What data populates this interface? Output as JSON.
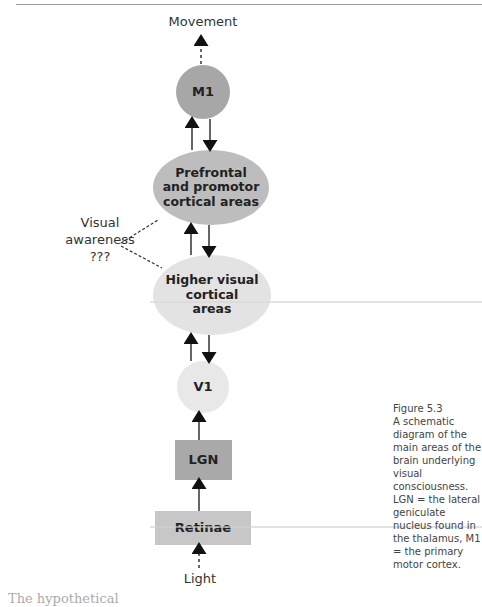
{
  "figure": {
    "top_label": "Movement",
    "bottom_label": "Light",
    "side_label": {
      "line1": "Visual",
      "line2": "awareness",
      "line3": "???"
    },
    "nodes": [
      {
        "id": "m1",
        "label": "M1",
        "shape": "circle",
        "color": "#a7a7a7"
      },
      {
        "id": "prefrontal",
        "label": "Prefrontal and promotor cortical areas",
        "shape": "ellipse",
        "color": "#bdbdbd"
      },
      {
        "id": "higher-visual",
        "label": "Higher visual cortical areas",
        "shape": "ellipse",
        "color": "#e3e3e3"
      },
      {
        "id": "v1",
        "label": "V1",
        "shape": "circle",
        "color": "#e8e8e8"
      },
      {
        "id": "lgn",
        "label": "LGN",
        "shape": "rect",
        "color": "#a9a9a9"
      },
      {
        "id": "retinae",
        "label": "Retinae",
        "shape": "rect",
        "color": "#c7c7c7"
      }
    ],
    "caption": {
      "title": "Figure 5.3",
      "text": "A schematic diagram of the main areas of the brain underlying visual consciousness. LGN = the lateral geniculate nucleus found in the thalamus, M1 = the primary motor cortex."
    },
    "footer_partial": "The hypothetical"
  }
}
